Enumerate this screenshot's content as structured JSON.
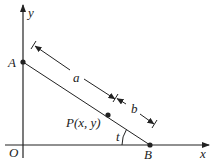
{
  "diagram": {
    "axes": {
      "x_label": "x",
      "y_label": "y",
      "origin_label": "O"
    },
    "points": {
      "A": {
        "label": "A"
      },
      "B": {
        "label": "B"
      },
      "P": {
        "label": "P(x, y)"
      }
    },
    "segments": {
      "a_label": "a",
      "b_label": "b"
    },
    "angle": {
      "label": "t"
    },
    "colors": {
      "ink": "#222222",
      "background": "#ffffff"
    }
  }
}
